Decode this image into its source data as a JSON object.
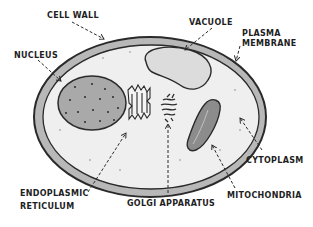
{
  "diagram": {
    "colors": {
      "outline": "#2a2a2a",
      "cell_wall_fill": "#b8b8b8",
      "cytoplasm_fill": "#efefef",
      "nucleus_fill": "#a9a9a9",
      "vacuole_fill": "#dcdcdc",
      "mitochondria_fill": "#8c8c8c",
      "organelle_fill": "#f4f4f4"
    },
    "labels": {
      "cell_wall": "CELL WALL",
      "nucleus": "NUCLEUS",
      "vacuole": "VACUOLE",
      "plasma_membrane_line1": "PLASMA",
      "plasma_membrane_line2": "MEMBRANE",
      "cytoplasm": "CYTOPLASM",
      "mitochondria": "MITOCHONDRIA",
      "golgi_apparatus": "GOLGI APPARATUS",
      "endoplasmic_reticulum_line1": "ENDOPLASMIC",
      "endoplasmic_reticulum_line2": "RETICULUM"
    }
  }
}
